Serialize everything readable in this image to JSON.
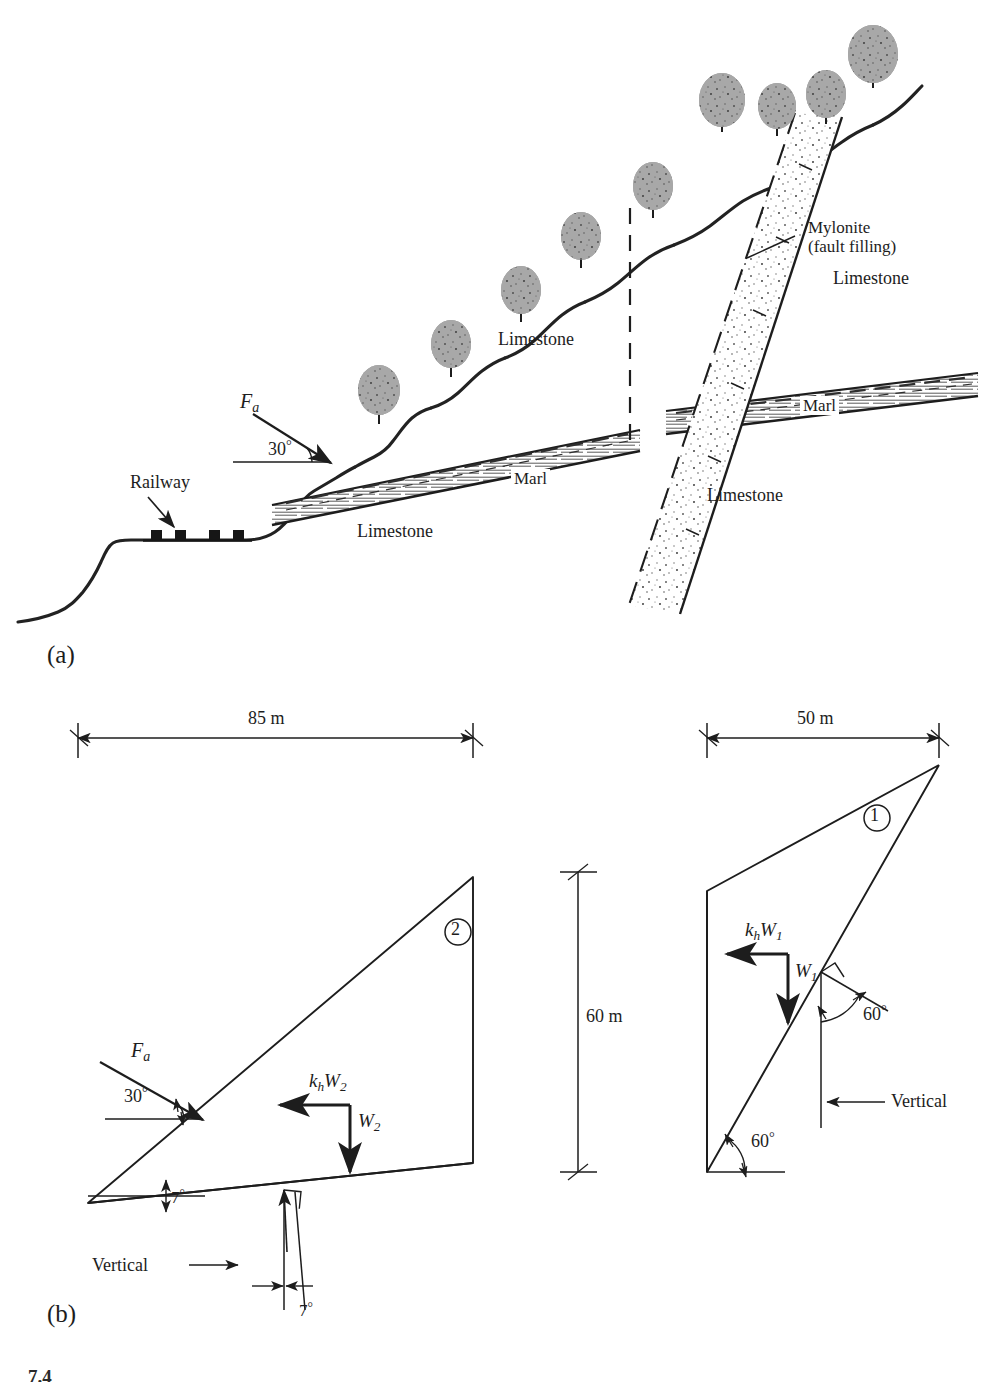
{
  "figure": {
    "panels": [
      {
        "id": "panel-a",
        "label": "(a)"
      },
      {
        "id": "panel-b",
        "label": "(b)"
      }
    ],
    "caption_partial": "7.4"
  },
  "panel_a": {
    "title_note": "Geological cross-section of a limestone slope with marl bed and mylonite-filled fault",
    "labels": {
      "railway": "Railway",
      "force_applied": "F",
      "force_applied_sub": "a",
      "slope_angle": "30",
      "degree": "°",
      "limestone_left": "Limestone",
      "limestone_upper": "Limestone",
      "limestone_right_upper": "Limestone",
      "limestone_right_lower": "Limestone",
      "marl_left": "Marl",
      "marl_right": "Marl",
      "mylonite_line1": "Mylonite",
      "mylonite_line2": "(fault filling)"
    },
    "tree_count": 8,
    "railway_tie_count": 4
  },
  "panel_b": {
    "dimensions": [
      {
        "name": "width-left",
        "value": "85 m"
      },
      {
        "name": "width-right",
        "value": "50 m"
      },
      {
        "name": "height-center",
        "value": "60 m"
      }
    ],
    "wedge_1": {
      "id_label": "①",
      "forces": {
        "horizontal": "k",
        "horizontal_sub_h": "h",
        "horizontal_w": "W",
        "horizontal_w_sub": "1",
        "weight": "W",
        "weight_sub": "1"
      },
      "angles": {
        "base_angle": "60",
        "normal_angle": "60",
        "degree": "°"
      },
      "vertical_label": "Vertical"
    },
    "wedge_2": {
      "id_label": "②",
      "forces": {
        "applied": "F",
        "applied_sub": "a",
        "horizontal": "k",
        "horizontal_sub_h": "h",
        "horizontal_w": "W",
        "horizontal_w_sub": "2",
        "weight": "W",
        "weight_sub": "2"
      },
      "angles": {
        "applied_angle": "30",
        "base_angle": "7",
        "normal_angle": "7",
        "degree": "°"
      },
      "vertical_label": "Vertical"
    }
  },
  "colors": {
    "ink": "#1d1d1d",
    "line": "#222222",
    "hatch": "#3a3a3a",
    "paper": "#ffffff"
  }
}
